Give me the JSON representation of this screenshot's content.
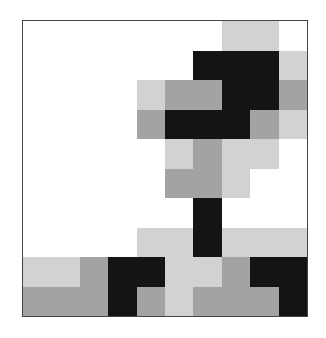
{
  "palette": {
    "W": "#ffffff",
    "L": "#d2d2d2",
    "M": "#a3a3a3",
    "D": "#141414"
  },
  "grid": {
    "rows": 10,
    "cols": 10,
    "cells": [
      [
        "W",
        "W",
        "W",
        "W",
        "W",
        "W",
        "W",
        "L",
        "L",
        "W"
      ],
      [
        "W",
        "W",
        "W",
        "W",
        "W",
        "W",
        "D",
        "D",
        "D",
        "L"
      ],
      [
        "W",
        "W",
        "W",
        "W",
        "L",
        "M",
        "M",
        "D",
        "D",
        "M"
      ],
      [
        "W",
        "W",
        "W",
        "W",
        "M",
        "D",
        "D",
        "D",
        "M",
        "L"
      ],
      [
        "W",
        "W",
        "W",
        "W",
        "W",
        "L",
        "M",
        "L",
        "L",
        "W"
      ],
      [
        "W",
        "W",
        "W",
        "W",
        "W",
        "M",
        "M",
        "L",
        "W",
        "W"
      ],
      [
        "W",
        "W",
        "W",
        "W",
        "W",
        "W",
        "D",
        "W",
        "W",
        "W"
      ],
      [
        "W",
        "W",
        "W",
        "W",
        "L",
        "L",
        "D",
        "L",
        "L",
        "L"
      ],
      [
        "L",
        "L",
        "M",
        "D",
        "D",
        "L",
        "L",
        "M",
        "D",
        "D"
      ],
      [
        "M",
        "M",
        "M",
        "D",
        "M",
        "L",
        "M",
        "M",
        "M",
        "D"
      ]
    ]
  }
}
